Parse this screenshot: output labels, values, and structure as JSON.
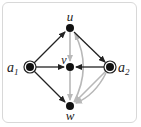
{
  "diagram": {
    "type": "directed-graph",
    "colors": {
      "primary_edge": "#222222",
      "secondary_edge": "#b8b8b8",
      "node": "#111111",
      "frame": "#d8d8d8"
    },
    "nodes": [
      {
        "id": "u",
        "label": "u",
        "x": 70,
        "y": 28,
        "shape": "dot",
        "label_pos": "above"
      },
      {
        "id": "v",
        "label": "v",
        "x": 70,
        "y": 67,
        "shape": "dot",
        "label_pos": "above-left"
      },
      {
        "id": "w",
        "label": "w",
        "x": 70,
        "y": 106,
        "shape": "dot",
        "label_pos": "below"
      },
      {
        "id": "a1",
        "label": "a",
        "sub": "1",
        "x": 30,
        "y": 67,
        "shape": "double-circle",
        "label_pos": "left"
      },
      {
        "id": "a2",
        "label": "a",
        "sub": "2",
        "x": 110,
        "y": 67,
        "shape": "double-circle",
        "label_pos": "right"
      }
    ],
    "edges": [
      {
        "from": "a1",
        "to": "u",
        "style": "black"
      },
      {
        "from": "a1",
        "to": "v",
        "style": "black"
      },
      {
        "from": "a1",
        "to": "w",
        "style": "black"
      },
      {
        "from": "u",
        "to": "a2",
        "style": "black"
      },
      {
        "from": "a2",
        "to": "v",
        "style": "black"
      },
      {
        "from": "u",
        "to": "v",
        "style": "gray"
      },
      {
        "from": "v",
        "to": "w",
        "style": "gray"
      },
      {
        "from": "a2",
        "to": "w",
        "style": "gray"
      },
      {
        "from": "w",
        "to": "u",
        "style": "gray",
        "curved": true
      },
      {
        "from": "a2",
        "to": "w",
        "style": "gray",
        "curved": true
      }
    ]
  }
}
